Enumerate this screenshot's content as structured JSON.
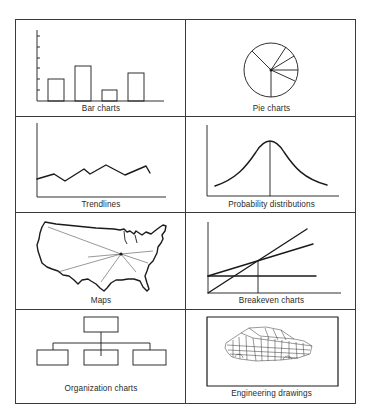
{
  "figure": {
    "panels": [
      {
        "id": "bar",
        "caption": "Bar charts",
        "icon": "bar-chart-icon"
      },
      {
        "id": "pie",
        "caption": "Pie charts",
        "icon": "pie-chart-icon"
      },
      {
        "id": "trend",
        "caption": "Trendlines",
        "icon": "trendline-icon"
      },
      {
        "id": "prob",
        "caption": "Probability distributions",
        "icon": "bell-curve-icon"
      },
      {
        "id": "maps",
        "caption": "Maps",
        "icon": "us-map-icon"
      },
      {
        "id": "breakeven",
        "caption": "Breakeven charts",
        "icon": "breakeven-chart-icon"
      },
      {
        "id": "org",
        "caption": "Organization charts",
        "icon": "org-chart-icon"
      },
      {
        "id": "eng",
        "caption": "Engineering drawings",
        "icon": "car-wireframe-icon"
      }
    ],
    "colors": {
      "ink": "#1a1a1a",
      "border": "#3a3a3a",
      "background": "#ffffff"
    }
  }
}
